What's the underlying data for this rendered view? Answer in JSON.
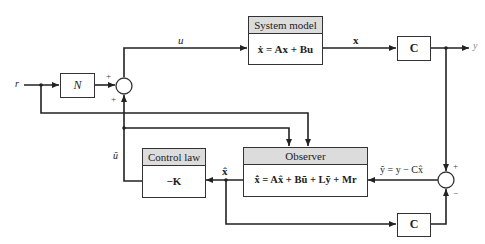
{
  "diagram": {
    "input_label": "r",
    "output_label": "y",
    "gain_block": {
      "label": "N"
    },
    "system_model": {
      "title": "System model",
      "equation": "ẋ = Ax + Bu"
    },
    "output_block_top": {
      "label": "C"
    },
    "output_block_bottom": {
      "label": "C"
    },
    "control_law": {
      "title": "Control law",
      "equation": "−K"
    },
    "observer": {
      "title": "Observer",
      "equation": "x̂̇ = Ax̂ + Bũ + Lỹ + Mr"
    },
    "signals": {
      "u": "u",
      "x": "x",
      "u_tilde": "ũ",
      "x_hat": "x̂",
      "y_tilde": "ỹ = y − Cx̂"
    },
    "summing_junction_1": {
      "top_sign": "+",
      "bottom_sign": "+"
    },
    "summing_junction_2": {
      "top_sign": "+",
      "bottom_sign": "−"
    },
    "colors": {
      "line": "#222222",
      "header_fill": "#dcdcdc",
      "box_border": "#333333"
    }
  }
}
